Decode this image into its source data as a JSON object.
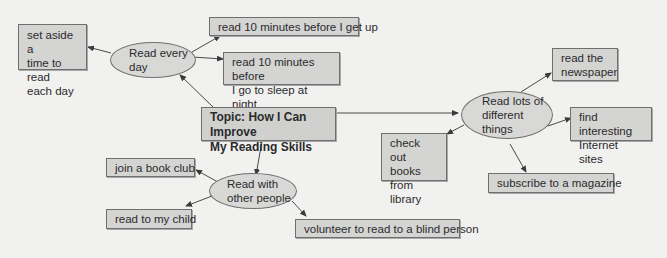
{
  "diagram": {
    "type": "concept-map",
    "colors": {
      "background": "#f1f1f0",
      "box_fill": "#d4d4d3",
      "border": "#6f6f6f",
      "line": "#4a4a4a"
    },
    "topic": {
      "line1": "Topic: How I Can Improve",
      "line2": "My Reading Skills"
    },
    "branches": {
      "read_every_day": {
        "label_line1": "Read every",
        "label_line2": "day",
        "children": {
          "set_aside": {
            "line1": "set aside a",
            "line2": "time to read",
            "line3": "each day"
          },
          "before_get_up": {
            "line1": "read 10 minutes before I get up"
          },
          "before_sleep": {
            "line1": "read 10 minutes before",
            "line2": "I go to sleep at night"
          }
        }
      },
      "read_with_others": {
        "label_line1": "Read with",
        "label_line2": "other people",
        "children": {
          "book_club": {
            "line1": "join a book club"
          },
          "my_child": {
            "line1": "read to my child"
          },
          "blind_person": {
            "line1": "volunteer to read to a blind person"
          }
        }
      },
      "read_different_things": {
        "label_line1": "Read lots of",
        "label_line2": "different",
        "label_line3": "things",
        "children": {
          "newspaper": {
            "line1": "read the",
            "line2": "newspaper"
          },
          "internet": {
            "line1": "find interesting",
            "line2": "Internet sites"
          },
          "library": {
            "line1": "check out",
            "line2": "books from",
            "line3": "library"
          },
          "magazine": {
            "line1": "subscribe to a magazine"
          }
        }
      }
    }
  }
}
